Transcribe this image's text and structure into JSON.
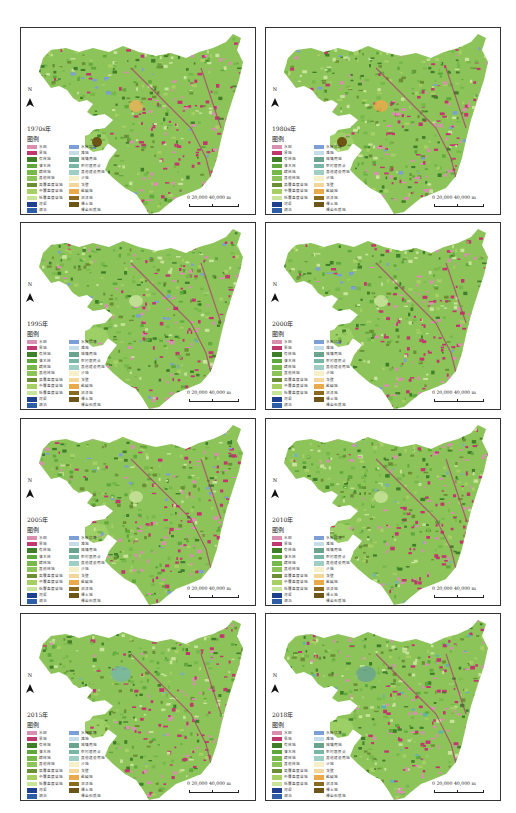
{
  "figure": {
    "layout": "2 columns x 4 rows of land-use maps",
    "north_label": "N",
    "legend_title": "图例",
    "scale_bar": {
      "ticks": [
        "0",
        "20,000",
        "40,000"
      ],
      "unit": "m",
      "text": "0   20,000  40,000 m"
    }
  },
  "legend_items": {
    "left": [
      {
        "label": "水田",
        "color": "#d98fb0"
      },
      {
        "label": "旱地",
        "color": "#c2386e"
      },
      {
        "label": "有林地",
        "color": "#3f7f2a"
      },
      {
        "label": "灌木林",
        "color": "#5fa83b"
      },
      {
        "label": "疏林地",
        "color": "#76b84a"
      },
      {
        "label": "其他林地",
        "color": "#8cc45a"
      },
      {
        "label": "高覆盖度草地",
        "color": "#6c8f36"
      },
      {
        "label": "中覆盖度草地",
        "color": "#a6cf64"
      },
      {
        "label": "低覆盖度草地",
        "color": "#c8e39a"
      },
      {
        "label": "河渠",
        "color": "#1f3f8f"
      },
      {
        "label": "湖泊",
        "color": "#2f5ea8"
      }
    ],
    "right": [
      {
        "label": "水库坑塘",
        "color": "#7b9fd6"
      },
      {
        "label": "滩地",
        "color": "#c5dde8"
      },
      {
        "label": "城镇用地",
        "color": "#6aa48e"
      },
      {
        "label": "农村居民点",
        "color": "#79b6a6"
      },
      {
        "label": "其他建设用地",
        "color": "#9fcfc4"
      },
      {
        "label": "沙地",
        "color": "#f6f0c8"
      },
      {
        "label": "戈壁",
        "color": "#f3d79a"
      },
      {
        "label": "盐碱地",
        "color": "#eaa94a"
      },
      {
        "label": "沼泽地",
        "color": "#8a6a1e"
      },
      {
        "label": "裸土地",
        "color": "#6d5518"
      },
      {
        "label": "裸岩石质地",
        "color": "#ffffff"
      }
    ]
  },
  "panels": [
    {
      "year": "1970s年",
      "col": 0,
      "row": 0,
      "accent": "#e7b45a",
      "water": "#7b9fd6"
    },
    {
      "year": "1980s年",
      "col": 1,
      "row": 0,
      "accent": "#eaa94a",
      "water": "#7b9fd6"
    },
    {
      "year": "1995年",
      "col": 0,
      "row": 1,
      "accent": "#c8e39a",
      "water": "#7b9fd6"
    },
    {
      "year": "2000年",
      "col": 1,
      "row": 1,
      "accent": "#c8e39a",
      "water": "#7b9fd6"
    },
    {
      "year": "2005年",
      "col": 0,
      "row": 2,
      "accent": "#c8e39a",
      "water": "#7b9fd6"
    },
    {
      "year": "2010年",
      "col": 1,
      "row": 2,
      "accent": "#c8e39a",
      "water": "#79b6a6"
    },
    {
      "year": "2015年",
      "col": 0,
      "row": 3,
      "accent": "#79b6a6",
      "water": "#79b6a6"
    },
    {
      "year": "2018年",
      "col": 1,
      "row": 3,
      "accent": "#6aa48e",
      "water": "#5fb3b0"
    }
  ],
  "panel_text": {
    "p0": {
      "year": "1970s年"
    },
    "p1": {
      "year": "1980s年"
    },
    "p2": {
      "year": "1995年"
    },
    "p3": {
      "year": "2000年"
    },
    "p4": {
      "year": "2005年"
    },
    "p5": {
      "year": "2010年"
    },
    "p6": {
      "year": "2015年"
    },
    "p7": {
      "year": "2018年"
    }
  }
}
